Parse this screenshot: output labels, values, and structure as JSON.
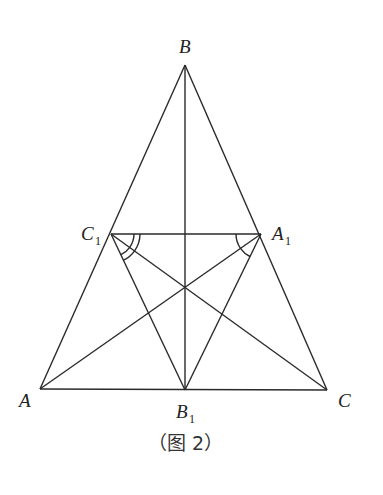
{
  "diagram": {
    "type": "geometry",
    "caption": "（图 2）",
    "points": {
      "A": {
        "label": "A",
        "sub": "",
        "x": 40,
        "y": 389
      },
      "B": {
        "label": "B",
        "sub": "",
        "x": 185,
        "y": 65
      },
      "C": {
        "label": "C",
        "sub": "",
        "x": 327,
        "y": 390
      },
      "A1": {
        "label": "A",
        "sub": "1",
        "x": 261,
        "y": 234
      },
      "B1": {
        "label": "B",
        "sub": "1",
        "x": 185,
        "y": 390
      },
      "C1": {
        "label": "C",
        "sub": "1",
        "x": 111,
        "y": 234
      }
    },
    "segments": [
      [
        "A",
        "B"
      ],
      [
        "B",
        "C"
      ],
      [
        "A",
        "C"
      ],
      [
        "B",
        "B1"
      ],
      [
        "C1",
        "A1"
      ],
      [
        "A",
        "A1"
      ],
      [
        "C",
        "C1"
      ],
      [
        "C1",
        "B1"
      ],
      [
        "A1",
        "B1"
      ]
    ],
    "angle_marks": [
      {
        "vertex": "C1",
        "between": [
          "A1",
          "C"
        ],
        "arcs": 2
      },
      {
        "vertex": "C1",
        "between": [
          "C",
          "B1"
        ],
        "arcs": 1
      },
      {
        "vertex": "A1",
        "between": [
          "C1",
          "A"
        ],
        "arcs": 1
      },
      {
        "vertex": "A1",
        "between": [
          "A",
          "B1"
        ],
        "arcs": 1
      }
    ]
  }
}
